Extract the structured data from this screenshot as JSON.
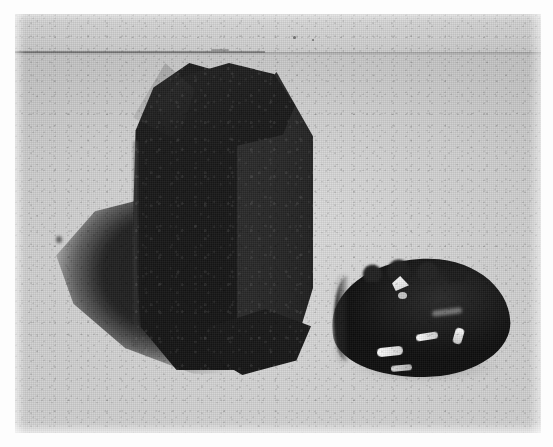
{
  "figure": {
    "domain": "Natural-Image",
    "caption": "Scanned halftone photograph of two dark mineral specimens on a pale gray background",
    "medium": "black-and-white halftone print scan",
    "canvas": {
      "width": 553,
      "height": 447,
      "background_color": "#ffffff"
    },
    "plate": {
      "label": "photograph-plate",
      "left": 15,
      "top": 14,
      "width": 526,
      "height": 419,
      "border": "none",
      "margin_color": "#fdfdfd"
    }
  },
  "background": {
    "label": "studio backdrop and table surface",
    "upper_band_label": "upper backdrop",
    "upper_band_color": "#e2e2e2",
    "seam_label": "backdrop-to-table seam line",
    "seam_y": 52,
    "lower_surface_label": "table surface",
    "lower_surface_color": "#d8d8d8",
    "grain": "halftone dot screen"
  },
  "objects": [
    {
      "id": "crystal",
      "label": "prismatic crystal block",
      "description": "Tall dark prismatic crystal with chamfered top, a broad front face, a lighter right side face and a beveled base",
      "position": {
        "left": 118,
        "top": 49,
        "width": 180,
        "height": 307
      },
      "body_color": "#1a1a1a",
      "side_face_color": "#2a2a2a",
      "surface": "matte, granular",
      "faces": [
        {
          "name": "front-face",
          "tone": "darkest"
        },
        {
          "name": "right-side-face",
          "tone": "mid-dark"
        },
        {
          "name": "top-chamfer",
          "tone": "dark"
        },
        {
          "name": "bottom-bevel",
          "tone": "darkest"
        }
      ]
    },
    {
      "id": "nodule",
      "label": "rounded glassy nodule",
      "description": "Smaller dark rounded nodule with a knobbly upper edge, a pale crescent rim on its left side and several bright specular highlights",
      "position": {
        "left": 313,
        "top": 245,
        "width": 182,
        "height": 123
      },
      "body_color": "#1c1c1c",
      "highlight_color": "#ffffff",
      "surface": "vitreous, reflective",
      "highlights": [
        {
          "name": "top-triangular-highlight",
          "shape": "triangle"
        },
        {
          "name": "upper-secondary-highlight",
          "shape": "dot"
        },
        {
          "name": "mid-streak-highlight",
          "shape": "streak"
        },
        {
          "name": "lower-left-streak-highlight",
          "shape": "streak"
        },
        {
          "name": "lower-secondary-streak-highlight",
          "shape": "streak"
        },
        {
          "name": "right-edge-highlight",
          "shape": "streak"
        }
      ]
    }
  ],
  "shadows": [
    {
      "id": "cast-shadow",
      "label": "cast shadow of the crystal",
      "description": "Soft dark wedge-shaped shadow falling to the lower left of the prismatic crystal",
      "color": "#1a1a1a",
      "position": {
        "left": 24,
        "top": 175,
        "width": 215,
        "height": 185
      }
    },
    {
      "id": "nodule-contact-shadow",
      "label": "contact shadow beneath the nodule",
      "color": "#4a4a4a"
    }
  ],
  "blemishes": [
    {
      "id": "spot-a",
      "label": "dust speck upper area"
    },
    {
      "id": "spot-b",
      "label": "dust speck upper area"
    },
    {
      "id": "spot-c",
      "label": "dark blot left margin"
    },
    {
      "id": "spot-d",
      "label": "scratch mark near seam"
    }
  ]
}
